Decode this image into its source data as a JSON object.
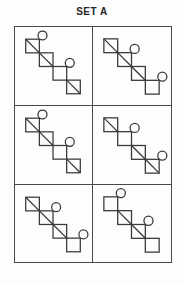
{
  "title": "SET A",
  "colors": {
    "background": "#fdfdfd",
    "stroke": "#3a3a3a",
    "grid_line": "#4a4a4a",
    "title_text": "#262626"
  },
  "figure_geometry": {
    "square_size": 14,
    "chain_start_x": 11,
    "chain_start_y": 12,
    "chain_step": 14,
    "squares_per_chain": 4,
    "circle_radius": 4.6,
    "circle_offset_x": 3.2,
    "circle_offset_y": -3.8,
    "stroke_width": 1.3
  },
  "grid": {
    "columns": 2,
    "rows": 3,
    "cells": [
      {
        "id": "r1c1",
        "diagonal_squares": [
          1,
          2,
          4
        ],
        "circle_squares": [
          1,
          3
        ]
      },
      {
        "id": "r1c2",
        "diagonal_squares": [
          1,
          2,
          3
        ],
        "circle_squares": [
          2,
          4
        ]
      },
      {
        "id": "r2c1",
        "diagonal_squares": [
          1,
          2,
          4
        ],
        "circle_squares": [
          1,
          3
        ]
      },
      {
        "id": "r2c2",
        "diagonal_squares": [
          1,
          3,
          4
        ],
        "circle_squares": [
          2,
          4
        ]
      },
      {
        "id": "r3c1",
        "diagonal_squares": [
          1,
          2,
          3
        ],
        "circle_squares": [
          2,
          4
        ]
      },
      {
        "id": "r3c2",
        "diagonal_squares": [
          2,
          3
        ],
        "circle_squares": [
          1,
          3
        ]
      }
    ]
  }
}
